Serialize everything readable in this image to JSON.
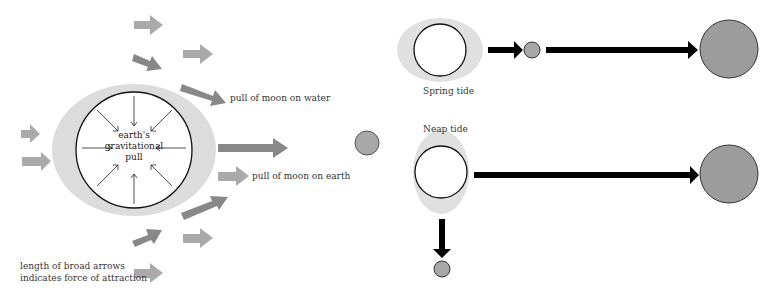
{
  "diagram": {
    "colors": {
      "water_bulge": "#dcdcdc",
      "earth_fill": "#ffffff",
      "outline": "#111111",
      "broad_arrow_light": "#a9a9a9",
      "broad_arrow_dark": "#868686",
      "moon_fill": "#a8a8a8",
      "sun_fill": "#9c9c9c",
      "tide_arrow": "#000000"
    },
    "left_panel": {
      "earth_label": [
        "earth's",
        "gravitational",
        "pull"
      ],
      "label_water": "pull of moon on water",
      "label_earth": "pull of moon on earth",
      "legend_line1": "length of broad arrows",
      "legend_line2": "indicates force of attraction"
    },
    "right_panel": {
      "spring_label": "Spring tide",
      "neap_label": "Neap tide"
    }
  }
}
